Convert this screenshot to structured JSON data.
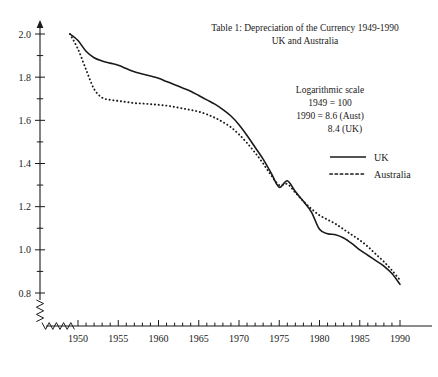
{
  "chart_data": {
    "type": "line",
    "title": "Table 1: Depreciation of the Currency 1949-1990",
    "subtitle": "UK and Australia",
    "xlabel": "",
    "ylabel": "",
    "xlim": [
      1949,
      1990
    ],
    "ylim": [
      0.8,
      2.0
    ],
    "grid": false,
    "axis_break": true,
    "legend_position": "upper right",
    "annotations": [
      "Logarithmic scale",
      "1949 = 100",
      "1990 = 8.6 (Aust)",
      "8.4 (UK)"
    ],
    "xticks": [
      1950,
      1955,
      1960,
      1965,
      1970,
      1975,
      1980,
      1985,
      1990
    ],
    "xtick_labels": [
      "1950",
      "1955",
      "1960",
      "1965",
      "1970",
      "1975",
      "1980",
      "1985",
      "1990"
    ],
    "xminor_step": 1,
    "yticks": [
      0.8,
      1.0,
      1.2,
      1.4,
      1.6,
      1.8,
      2.0
    ],
    "ytick_labels": [
      "0.8",
      "1.0",
      "1.2",
      "1.4",
      "1.6",
      "1.8",
      "2.0"
    ],
    "yminor_step": 0.1,
    "x": [
      1949,
      1950,
      1951,
      1952,
      1953,
      1954,
      1955,
      1956,
      1957,
      1958,
      1959,
      1960,
      1961,
      1962,
      1963,
      1964,
      1965,
      1966,
      1967,
      1968,
      1969,
      1970,
      1971,
      1972,
      1973,
      1974,
      1975,
      1976,
      1977,
      1978,
      1979,
      1980,
      1981,
      1982,
      1983,
      1984,
      1985,
      1986,
      1987,
      1988,
      1989,
      1990
    ],
    "series": [
      {
        "name": "UK",
        "style": "solid",
        "color": "#1a1a1a",
        "values": [
          2.0,
          1.97,
          1.92,
          1.89,
          1.875,
          1.865,
          1.855,
          1.84,
          1.825,
          1.815,
          1.805,
          1.795,
          1.78,
          1.765,
          1.75,
          1.735,
          1.715,
          1.695,
          1.675,
          1.65,
          1.62,
          1.58,
          1.53,
          1.475,
          1.42,
          1.355,
          1.29,
          1.32,
          1.27,
          1.225,
          1.175,
          1.095,
          1.075,
          1.07,
          1.055,
          1.03,
          1.0,
          0.975,
          0.95,
          0.925,
          0.89,
          0.84
        ]
      },
      {
        "name": "Australia",
        "style": "dotted",
        "color": "#1a1a1a",
        "values": [
          2.0,
          1.93,
          1.835,
          1.745,
          1.705,
          1.695,
          1.69,
          1.685,
          1.68,
          1.678,
          1.675,
          1.672,
          1.668,
          1.662,
          1.655,
          1.648,
          1.64,
          1.628,
          1.612,
          1.592,
          1.568,
          1.535,
          1.495,
          1.45,
          1.4,
          1.345,
          1.3,
          1.305,
          1.265,
          1.225,
          1.19,
          1.16,
          1.14,
          1.12,
          1.095,
          1.07,
          1.045,
          1.015,
          0.98,
          0.945,
          0.905,
          0.86
        ]
      }
    ]
  },
  "legend": {
    "items": [
      {
        "label": "UK",
        "style": "solid"
      },
      {
        "label": "Australia",
        "style": "dotted"
      }
    ]
  }
}
